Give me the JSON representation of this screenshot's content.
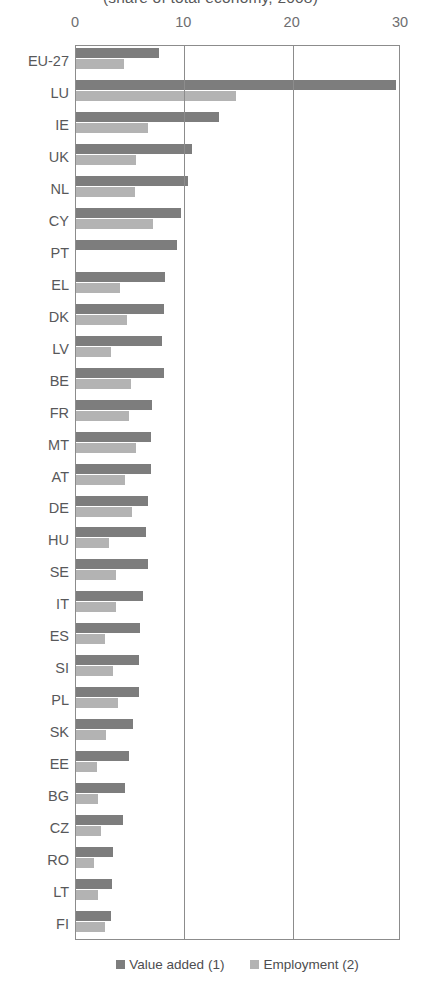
{
  "chart_data": {
    "type": "bar",
    "orientation": "horizontal",
    "title": "(share of total economy, 2008)",
    "xlabel": "",
    "ylabel": "",
    "xlim": [
      0,
      30
    ],
    "xticks": [
      0,
      10,
      20,
      30
    ],
    "xtick_labels": [
      "0",
      "10",
      "20",
      "30"
    ],
    "grid": true,
    "legend_position": "bottom",
    "categories": [
      "EU-27",
      "LU",
      "IE",
      "UK",
      "NL",
      "CY",
      "PT",
      "EL",
      "DK",
      "LV",
      "BE",
      "FR",
      "MT",
      "AT",
      "DE",
      "HU",
      "SE",
      "IT",
      "ES",
      "SI",
      "PL",
      "SK",
      "EE",
      "BG",
      "CZ",
      "RO",
      "LT",
      "FI"
    ],
    "series": [
      {
        "name": "Value added (1)",
        "color": "#7d7d7d",
        "values": [
          7.7,
          29.5,
          13.2,
          10.7,
          10.3,
          9.7,
          9.3,
          8.2,
          8.1,
          7.9,
          8.1,
          7.0,
          6.9,
          6.9,
          6.6,
          6.5,
          6.6,
          6.2,
          5.9,
          5.8,
          5.8,
          5.3,
          4.9,
          4.5,
          4.3,
          3.4,
          3.3,
          3.2
        ]
      },
      {
        "name": "Employment (2)",
        "color": "#b3b3b3",
        "values": [
          4.4,
          14.8,
          6.6,
          5.5,
          5.4,
          7.1,
          0.0,
          4.1,
          4.7,
          3.2,
          5.1,
          4.9,
          5.5,
          4.5,
          5.2,
          3.0,
          3.7,
          3.7,
          2.7,
          3.4,
          3.9,
          2.8,
          1.9,
          2.0,
          2.3,
          1.7,
          2.0,
          2.7
        ]
      }
    ]
  },
  "legend": {
    "items": [
      {
        "label": "Value added (1)",
        "color": "#7d7d7d"
      },
      {
        "label": "Employment (2)",
        "color": "#b3b3b3"
      }
    ]
  }
}
